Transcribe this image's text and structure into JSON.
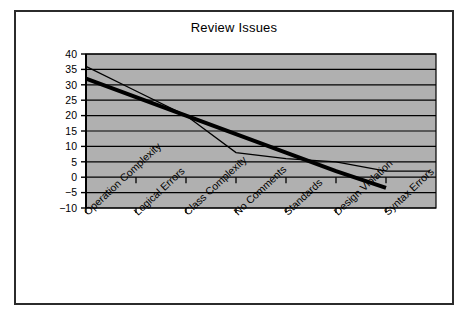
{
  "page": {
    "background": "#ffffff",
    "border_color": "#2b2b2b"
  },
  "chart_data": {
    "type": "line",
    "title": "Review Issues",
    "xlabel": "",
    "ylabel": "",
    "ylim": [
      -10,
      40
    ],
    "ytick_step": 5,
    "yticks": [
      "40",
      "35",
      "30",
      "25",
      "20",
      "15",
      "10",
      "5",
      "0",
      "−5",
      "−10"
    ],
    "ytick_values": [
      40,
      35,
      30,
      25,
      20,
      15,
      10,
      5,
      0,
      -5,
      -10
    ],
    "grid": "horizontal",
    "legend": "none",
    "plot_background": "#b0b0b0",
    "gridline_color": "#000000",
    "categories": [
      "Operation Complexity",
      "Logical Errors",
      "Class Complexity",
      "No Comments",
      "Standards",
      "Design Violation",
      "Syntax Errors"
    ],
    "series": [
      {
        "name": "Issues",
        "style": "thin-line",
        "color": "#000000",
        "width": 1.3,
        "values": [
          36,
          28,
          20,
          8,
          6,
          5,
          2
        ]
      },
      {
        "name": "Linear Trend",
        "style": "thick-trendline",
        "color": "#000000",
        "width": 4,
        "values": [
          32,
          26,
          20,
          14,
          8,
          2,
          -3.5
        ]
      }
    ]
  }
}
